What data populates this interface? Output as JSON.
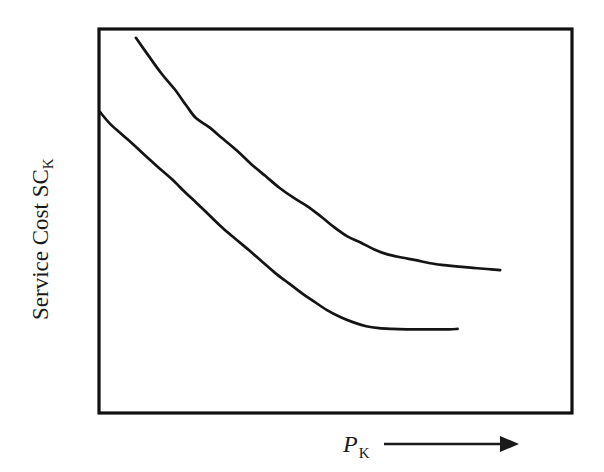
{
  "figure": {
    "background_color": "#ffffff",
    "ink_color": "#141414"
  },
  "axes": {
    "y_label_main": "Service Cost SC",
    "y_label_subscript": "K",
    "x_label_main": "P",
    "x_label_subscript": "K",
    "x_arrow_icon": "right-arrow-icon",
    "frame": {
      "left": 99,
      "top": 29,
      "right": 572,
      "bottom": 413
    }
  },
  "chart_data": {
    "type": "line",
    "title": "",
    "xlabel": "P_K",
    "ylabel": "Service Cost SC_K",
    "grid": false,
    "legend": "none",
    "axis_ticks": "none",
    "xlim": [
      0,
      1
    ],
    "ylim": [
      0,
      1
    ],
    "annotations": [],
    "series": [
      {
        "name": "upper-curve",
        "points": [
          [
            0.078,
            0.977
          ],
          [
            0.105,
            0.93
          ],
          [
            0.132,
            0.884
          ],
          [
            0.16,
            0.843
          ],
          [
            0.185,
            0.8
          ],
          [
            0.205,
            0.768
          ],
          [
            0.232,
            0.745
          ],
          [
            0.262,
            0.714
          ],
          [
            0.292,
            0.683
          ],
          [
            0.322,
            0.648
          ],
          [
            0.352,
            0.617
          ],
          [
            0.382,
            0.586
          ],
          [
            0.412,
            0.56
          ],
          [
            0.44,
            0.539
          ],
          [
            0.468,
            0.513
          ],
          [
            0.497,
            0.484
          ],
          [
            0.525,
            0.46
          ],
          [
            0.553,
            0.444
          ],
          [
            0.582,
            0.426
          ],
          [
            0.61,
            0.413
          ],
          [
            0.64,
            0.405
          ],
          [
            0.67,
            0.398
          ],
          [
            0.7,
            0.39
          ],
          [
            0.73,
            0.385
          ],
          [
            0.76,
            0.381
          ],
          [
            0.79,
            0.378
          ],
          [
            0.82,
            0.375
          ],
          [
            0.848,
            0.372
          ]
        ]
      },
      {
        "name": "lower-curve",
        "points": [
          [
            0.002,
            0.784
          ],
          [
            0.022,
            0.755
          ],
          [
            0.045,
            0.729
          ],
          [
            0.072,
            0.7
          ],
          [
            0.1,
            0.668
          ],
          [
            0.128,
            0.637
          ],
          [
            0.155,
            0.608
          ],
          [
            0.182,
            0.575
          ],
          [
            0.208,
            0.545
          ],
          [
            0.235,
            0.513
          ],
          [
            0.262,
            0.481
          ],
          [
            0.29,
            0.452
          ],
          [
            0.318,
            0.423
          ],
          [
            0.345,
            0.394
          ],
          [
            0.372,
            0.365
          ],
          [
            0.4,
            0.339
          ],
          [
            0.428,
            0.313
          ],
          [
            0.455,
            0.29
          ],
          [
            0.482,
            0.268
          ],
          [
            0.51,
            0.25
          ],
          [
            0.538,
            0.236
          ],
          [
            0.565,
            0.226
          ],
          [
            0.592,
            0.221
          ],
          [
            0.62,
            0.219
          ],
          [
            0.65,
            0.218
          ],
          [
            0.68,
            0.218
          ],
          [
            0.71,
            0.218
          ],
          [
            0.74,
            0.218
          ],
          [
            0.758,
            0.219
          ]
        ]
      }
    ]
  }
}
